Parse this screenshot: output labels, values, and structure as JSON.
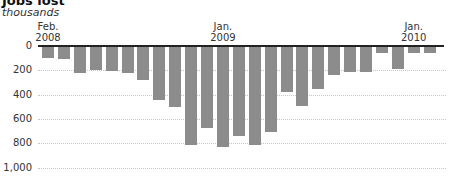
{
  "chart_data": {
    "type": "bar",
    "title": "Jobs lost",
    "subtitle": "thousands",
    "xlabel": "",
    "ylabel": "thousands",
    "ylim": [
      0,
      1000
    ],
    "y_inverted": true,
    "yticks": [
      "0",
      "200",
      "400",
      "600",
      "800",
      "1,000"
    ],
    "x_tick_labels": [
      {
        "index": 0,
        "line1": "Feb.",
        "line2": "2008"
      },
      {
        "index": 11,
        "line1": "Jan.",
        "line2": "2009"
      },
      {
        "index": 23,
        "line1": "Jan.",
        "line2": "2010"
      }
    ],
    "categories": [
      "Feb 2008",
      "Mar 2008",
      "Apr 2008",
      "May 2008",
      "Jun 2008",
      "Jul 2008",
      "Aug 2008",
      "Sep 2008",
      "Oct 2008",
      "Nov 2008",
      "Dec 2008",
      "Jan 2009",
      "Feb 2009",
      "Mar 2009",
      "Apr 2009",
      "May 2009",
      "Jun 2009",
      "Jul 2009",
      "Aug 2009",
      "Sep 2009",
      "Oct 2009",
      "Nov 2009",
      "Dec 2009",
      "Jan 2010",
      "Feb 2010"
    ],
    "values": [
      87,
      100,
      212,
      190,
      200,
      218,
      275,
      438,
      493,
      805,
      668,
      822,
      732,
      805,
      697,
      370,
      487,
      348,
      230,
      205,
      205,
      46,
      178,
      46,
      46
    ],
    "grid": true,
    "legend": null,
    "colors": {
      "bar": "#8c8c8c",
      "zero_line": "#222222",
      "grid": "#c8c8c8"
    }
  }
}
